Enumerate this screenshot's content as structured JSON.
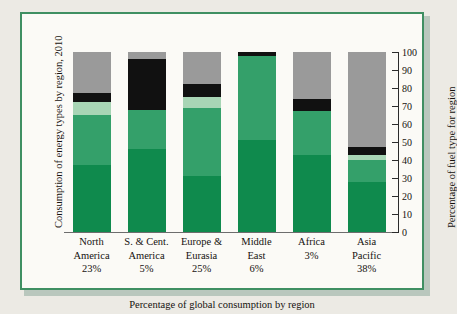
{
  "chart_data": {
    "type": "bar",
    "subtype": "stacked-100",
    "title": "",
    "xlabel": "Percentage of global consumption by region",
    "ylabel_left": "Consumption of energy types by region, 2010",
    "ylabel_right": "Percentage of fuel type for region",
    "ylim": [
      0,
      100
    ],
    "yticks": [
      0,
      10,
      20,
      30,
      40,
      50,
      60,
      70,
      80,
      90,
      100
    ],
    "grid": false,
    "legend": "none",
    "axis_position": "right",
    "categories": [
      "North America",
      "S. & Cent. America",
      "Europe & Eurasia",
      "Middle East",
      "Africa",
      "Asia Pacific"
    ],
    "category_lines": [
      [
        "North",
        "America",
        "23%"
      ],
      [
        "S. & Cent.",
        "America",
        "5%"
      ],
      [
        "Europe &",
        "Eurasia",
        "25%"
      ],
      [
        "Middle",
        "East",
        "6%"
      ],
      [
        "Africa",
        "3%",
        ""
      ],
      [
        "Asia",
        "Pacific",
        "38%"
      ]
    ],
    "category_share_of_global": [
      23,
      5,
      25,
      6,
      3,
      38
    ],
    "series": [
      {
        "name": "dark-green-segment",
        "color": "#0f8a4d",
        "values": [
          37,
          46,
          31,
          51,
          43,
          28
        ]
      },
      {
        "name": "medium-green-segment",
        "color": "#34a06a",
        "values": [
          28,
          22,
          38,
          47,
          24,
          12
        ]
      },
      {
        "name": "light-green-segment",
        "color": "#a8d5b5",
        "values": [
          7,
          0,
          6,
          0,
          0,
          3
        ]
      },
      {
        "name": "black-segment",
        "color": "#111111",
        "values": [
          5,
          28,
          7,
          2,
          7,
          4
        ]
      },
      {
        "name": "gray-segment",
        "color": "#9a9a9a",
        "values": [
          23,
          4,
          18,
          0,
          26,
          53
        ]
      }
    ],
    "stack_boundaries_percent": [
      [
        0,
        37,
        65,
        72,
        77,
        100
      ],
      [
        0,
        46,
        68,
        68,
        96,
        100
      ],
      [
        0,
        31,
        69,
        75,
        82,
        100
      ],
      [
        0,
        51,
        98,
        98,
        100,
        100
      ],
      [
        0,
        43,
        67,
        67,
        74,
        100
      ],
      [
        0,
        28,
        40,
        43,
        47,
        100
      ]
    ]
  },
  "colors": {
    "frame_border": "#3f8f62",
    "card_background": "#fbfaf6",
    "page_background": "#eceae4",
    "axis": "#2b2b2b",
    "text": "#16120f"
  }
}
